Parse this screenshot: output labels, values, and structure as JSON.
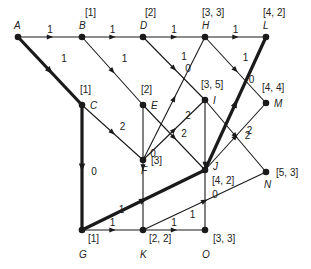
{
  "diagram": {
    "type": "directed-graph",
    "colors": {
      "line": "#1a1a1a",
      "background": "#ffffff"
    },
    "nodes": [
      {
        "id": "A",
        "x": 18,
        "y": 37,
        "tag": "",
        "name_dx": -4,
        "name_dy": -8,
        "tag_dx": 0,
        "tag_dy": 0
      },
      {
        "id": "B",
        "x": 82,
        "y": 37,
        "tag": "[1]",
        "name_dx": -3,
        "name_dy": -8,
        "tag_dx": 3,
        "tag_dy": -21
      },
      {
        "id": "D",
        "x": 143,
        "y": 37,
        "tag": "[2]",
        "name_dx": -3,
        "name_dy": -8,
        "tag_dx": 2,
        "tag_dy": -21
      },
      {
        "id": "H",
        "x": 205,
        "y": 37,
        "tag": "[3, 3]",
        "name_dx": -3,
        "name_dy": -8,
        "tag_dx": -3,
        "tag_dy": -21
      },
      {
        "id": "L",
        "x": 266,
        "y": 37,
        "tag": "[4, 2]",
        "name_dx": -3,
        "name_dy": -8,
        "tag_dx": -3,
        "tag_dy": -21
      },
      {
        "id": "C",
        "x": 82,
        "y": 105,
        "tag": "[1]",
        "name_dx": 8,
        "name_dy": 4,
        "tag_dx": -2,
        "tag_dy": -12
      },
      {
        "id": "E",
        "x": 143,
        "y": 105,
        "tag": "[2]",
        "name_dx": 8,
        "name_dy": 4,
        "tag_dx": -2,
        "tag_dy": -12
      },
      {
        "id": "I",
        "x": 205,
        "y": 100,
        "tag": "[3, 5]",
        "name_dx": 8,
        "name_dy": 4,
        "tag_dx": -4,
        "tag_dy": -12
      },
      {
        "id": "M",
        "x": 266,
        "y": 103,
        "tag": "[4, 4]",
        "name_dx": 8,
        "name_dy": 4,
        "tag_dx": -4,
        "tag_dy": -12
      },
      {
        "id": "F",
        "x": 143,
        "y": 160,
        "tag": "[3]",
        "name_dx": -2,
        "name_dy": 14,
        "tag_dx": 8,
        "tag_dy": 4
      },
      {
        "id": "J",
        "x": 205,
        "y": 170,
        "tag": "[4, 2]",
        "name_dx": 8,
        "name_dy": 0,
        "tag_dx": 7,
        "tag_dy": 14
      },
      {
        "id": "N",
        "x": 266,
        "y": 172,
        "tag": "[5, 3]",
        "name_dx": -2,
        "name_dy": 16,
        "tag_dx": 10,
        "tag_dy": 4
      },
      {
        "id": "G",
        "x": 82,
        "y": 230,
        "tag": "[1]",
        "name_dx": -3,
        "name_dy": 28,
        "tag_dx": 6,
        "tag_dy": 12
      },
      {
        "id": "K",
        "x": 143,
        "y": 230,
        "tag": "[2, 2]",
        "name_dx": -3,
        "name_dy": 28,
        "tag_dx": 6,
        "tag_dy": 12
      },
      {
        "id": "O",
        "x": 205,
        "y": 230,
        "tag": "[3, 3]",
        "name_dx": -3,
        "name_dy": 28,
        "tag_dx": 8,
        "tag_dy": 12
      }
    ],
    "edges": [
      {
        "from": "A",
        "to": "B",
        "weight": "1",
        "bold": false,
        "ldx": 0,
        "ldy": -7
      },
      {
        "from": "B",
        "to": "D",
        "weight": "1",
        "bold": false,
        "ldx": 0,
        "ldy": -7
      },
      {
        "from": "D",
        "to": "H",
        "weight": "1",
        "bold": false,
        "ldx": 0,
        "ldy": -7
      },
      {
        "from": "H",
        "to": "L",
        "weight": "1",
        "bold": false,
        "ldx": 0,
        "ldy": -7
      },
      {
        "from": "A",
        "to": "C",
        "weight": "1",
        "bold": true,
        "ldx": 14,
        "ldy": -12
      },
      {
        "from": "B",
        "to": "E",
        "weight": "1",
        "bold": false,
        "ldx": 12,
        "ldy": -12
      },
      {
        "from": "D",
        "to": "I",
        "weight": "1",
        "bold": false,
        "ldx": 10,
        "ldy": -12
      },
      {
        "from": "H",
        "to": "M",
        "weight": "1",
        "bold": false,
        "ldx": 10,
        "ldy": -12
      },
      {
        "from": "C",
        "to": "F",
        "weight": "2",
        "bold": false,
        "ldx": 10,
        "ldy": -6
      },
      {
        "from": "C",
        "to": "G",
        "weight": "0",
        "bold": true,
        "ldx": 12,
        "ldy": 4
      },
      {
        "from": "E",
        "to": "J",
        "weight": "2",
        "bold": false,
        "ldx": 10,
        "ldy": -4
      },
      {
        "from": "E",
        "to": "K",
        "weight": "0",
        "bold": false,
        "ldx": 10,
        "ldy": -14
      },
      {
        "from": "F",
        "to": "H",
        "weight": "0",
        "bold": false,
        "ldx": 14,
        "ldy": -30
      },
      {
        "from": "F",
        "to": "I",
        "weight": "2",
        "bold": false,
        "ldx": 14,
        "ldy": -14
      },
      {
        "from": "I",
        "to": "N",
        "weight": "2",
        "bold": false,
        "ldx": 12,
        "ldy": 0
      },
      {
        "from": "I",
        "to": "O",
        "weight": "0",
        "bold": false,
        "ldx": 10,
        "ldy": 30
      },
      {
        "from": "G",
        "to": "J",
        "weight": "1",
        "bold": true,
        "ldx": -22,
        "ldy": 10
      },
      {
        "from": "J",
        "to": "L",
        "weight": "0",
        "bold": true,
        "ldx": 16,
        "ldy": -24
      },
      {
        "from": "J",
        "to": "M",
        "weight": "2",
        "bold": false,
        "ldx": 14,
        "ldy": -6
      },
      {
        "from": "G",
        "to": "K",
        "weight": "1",
        "bold": false,
        "ldx": 0,
        "ldy": -7
      },
      {
        "from": "K",
        "to": "O",
        "weight": "1",
        "bold": false,
        "ldx": 0,
        "ldy": -7
      },
      {
        "from": "K",
        "to": "N",
        "weight": "1",
        "bold": false,
        "ldx": -12,
        "ldy": 14
      }
    ]
  }
}
